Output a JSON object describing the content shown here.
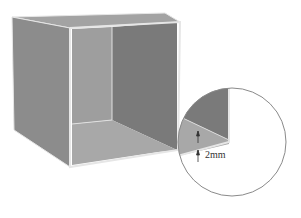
{
  "diagram": {
    "magnifier": {
      "label": "2mm",
      "description": "wall thickness detail"
    },
    "colors": {
      "outer_face": "#8c8c8c",
      "top_face": "#a3a3a3",
      "inner_left_wall": "#9e9e9e",
      "inner_back_wall": "#7a7a7a",
      "inner_floor": "#a8a8a8",
      "edge": "#e6e6e6",
      "circle_stroke": "#8a8a8a"
    }
  }
}
